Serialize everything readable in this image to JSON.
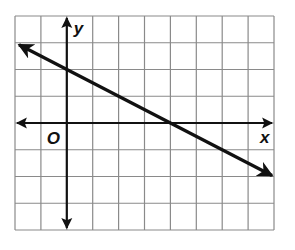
{
  "chart_data": {
    "type": "line",
    "title": "",
    "xlabel": "x",
    "ylabel": "y",
    "origin_label": "O",
    "xlim": [
      -2,
      8
    ],
    "ylim": [
      -4,
      4
    ],
    "grid": true,
    "grid_step": 1,
    "axis_tick_labels": false,
    "series": [
      {
        "name": "line",
        "equation": "y = -0.5x + 2",
        "slope": -0.5,
        "y_intercept": 2,
        "x_intercept": 4,
        "x": [
          -2,
          0,
          4,
          8
        ],
        "y": [
          3,
          2,
          0,
          -2
        ],
        "arrows_both_ends": true,
        "color": "#111111"
      }
    ]
  },
  "colors": {
    "grid": "#8a8a8a",
    "axis": "#111111",
    "line": "#111111"
  }
}
